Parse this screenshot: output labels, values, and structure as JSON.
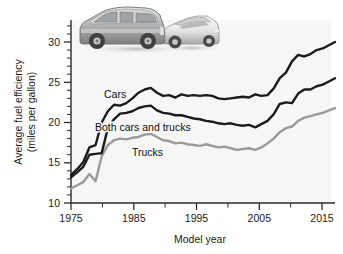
{
  "figure": {
    "caption_photo_alt": "photo-suv-and-sedan",
    "background_color": "#ffffff",
    "plot_background_color": "#f6f6f6"
  },
  "axes": {
    "x_title": "Model year",
    "y_title_line1": "Average fuel efficiency",
    "y_title_line2": "(miles per gallon)",
    "x_tick_labels": [
      "1975",
      "1985",
      "1995",
      "2005",
      "2015"
    ],
    "y_tick_labels": [
      "10",
      "15",
      "20",
      "25",
      "30"
    ]
  },
  "series_labels": {
    "cars": "Cars",
    "both": "Both cars and trucks",
    "trucks": "Trucks"
  },
  "colors": {
    "cars": "#1b1b1b",
    "both": "#1b1b1b",
    "trucks": "#9a9a9a",
    "axis": "#2b2b2b"
  },
  "chart_data": {
    "type": "line",
    "title": "",
    "xlabel": "Model year",
    "ylabel": "Average fuel efficiency (miles per gallon)",
    "xlim": [
      1975,
      2018
    ],
    "ylim": [
      10,
      31
    ],
    "x_ticks_major": [
      1975,
      1985,
      1995,
      2005,
      2015
    ],
    "x_ticks_minor": [
      1980,
      1990,
      2000,
      2010
    ],
    "y_ticks": [
      10,
      15,
      20,
      25,
      30
    ],
    "grid": false,
    "legend": "inline-labels",
    "x": [
      1975,
      1976,
      1977,
      1978,
      1979,
      1980,
      1981,
      1982,
      1983,
      1984,
      1985,
      1986,
      1987,
      1988,
      1989,
      1990,
      1991,
      1992,
      1993,
      1994,
      1995,
      1996,
      1997,
      1998,
      1999,
      2000,
      2001,
      2002,
      2003,
      2004,
      2005,
      2006,
      2007,
      2008,
      2009,
      2010,
      2011,
      2012,
      2013,
      2014,
      2015,
      2016,
      2017,
      2018
    ],
    "series": [
      {
        "name": "Cars",
        "color": "#1b1b1b",
        "values": [
          13.5,
          14.2,
          15.1,
          16.9,
          17.2,
          20.0,
          21.4,
          22.2,
          22.1,
          22.4,
          23.0,
          23.7,
          24.1,
          24.3,
          23.7,
          23.3,
          23.4,
          23.1,
          23.5,
          23.3,
          23.4,
          23.3,
          23.4,
          23.3,
          23.0,
          22.9,
          23.0,
          23.1,
          23.2,
          23.1,
          23.5,
          23.3,
          23.4,
          24.2,
          25.5,
          26.2,
          27.6,
          28.4,
          28.2,
          28.5,
          29.0,
          29.2,
          29.6,
          30.0
        ],
        "end_value": 30.0,
        "peak": {
          "year": 1988,
          "value": 24.3
        },
        "start_value": 13.5
      },
      {
        "name": "Both cars and trucks",
        "color": "#1b1b1b",
        "values": [
          13.2,
          13.8,
          14.5,
          16.0,
          16.1,
          16.2,
          19.3,
          20.4,
          21.1,
          21.2,
          21.4,
          21.8,
          22.0,
          22.1,
          21.5,
          21.2,
          21.1,
          20.9,
          20.9,
          20.7,
          20.5,
          20.4,
          20.2,
          20.1,
          19.9,
          19.8,
          19.9,
          19.7,
          19.6,
          19.7,
          19.4,
          19.8,
          20.2,
          21.0,
          22.3,
          22.5,
          22.4,
          23.6,
          24.1,
          24.1,
          24.5,
          24.7,
          25.1,
          25.5
        ],
        "end_value": 25.5,
        "trough": {
          "year": 2005,
          "value": 19.4
        },
        "start_value": 13.2
      },
      {
        "name": "Trucks",
        "color": "#9a9a9a",
        "values": [
          11.8,
          12.2,
          12.6,
          13.6,
          12.7,
          15.8,
          17.2,
          17.8,
          18.0,
          17.9,
          18.1,
          18.2,
          18.5,
          18.6,
          18.2,
          17.8,
          17.7,
          17.4,
          17.5,
          17.3,
          17.2,
          17.1,
          17.3,
          17.1,
          16.9,
          17.0,
          16.8,
          16.6,
          16.7,
          16.8,
          16.6,
          16.9,
          17.4,
          18.0,
          18.8,
          19.3,
          19.5,
          20.2,
          20.6,
          20.8,
          21.0,
          21.2,
          21.5,
          21.8
        ],
        "end_value": 21.8,
        "start_value": 11.8
      }
    ],
    "inline_annotations": [
      {
        "text": "Cars",
        "year": 1983,
        "value": 24.5
      },
      {
        "text": "Both cars and trucks",
        "year": 1983,
        "value": 19.8
      },
      {
        "text": "Trucks",
        "year": 1990,
        "value": 16.9
      }
    ]
  }
}
